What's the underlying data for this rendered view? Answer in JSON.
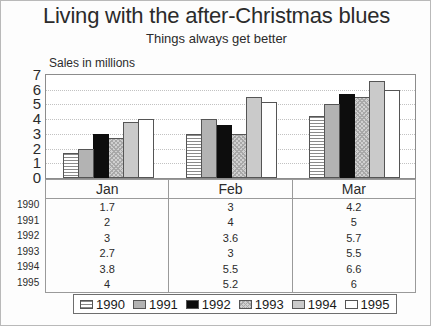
{
  "title": "Living with the after-Christmas blues",
  "subtitle": "Things always get better",
  "axis_note": "Sales in millions",
  "chart_data": {
    "type": "bar",
    "title": "Living with the after-Christmas blues",
    "subtitle": "Things always get better",
    "xlabel": "",
    "ylabel": "Sales in millions",
    "ylim": [
      0,
      7
    ],
    "yticks": [
      "0",
      "1",
      "2",
      "3",
      "4",
      "5",
      "6",
      "7"
    ],
    "grid": true,
    "legend_position": "bottom",
    "categories": [
      "Jan",
      "Feb",
      "Mar"
    ],
    "series": [
      {
        "name": "1990",
        "values": [
          1.7,
          3,
          4.2
        ],
        "pattern": "horizontal-lines",
        "color": "#ffffff"
      },
      {
        "name": "1991",
        "values": [
          2,
          4,
          5
        ],
        "pattern": "solid-gray",
        "color": "#b3b3b3"
      },
      {
        "name": "1992",
        "values": [
          3,
          3.6,
          5.7
        ],
        "pattern": "solid-black",
        "color": "#0d0d0d"
      },
      {
        "name": "1993",
        "values": [
          2.7,
          3,
          5.5
        ],
        "pattern": "checker-gray",
        "color": "#d0d0d0"
      },
      {
        "name": "1994",
        "values": [
          3.8,
          5.5,
          6.6
        ],
        "pattern": "light-gray",
        "color": "#cacaca"
      },
      {
        "name": "1995",
        "values": [
          4,
          5.2,
          6
        ],
        "pattern": "white",
        "color": "#ffffff"
      }
    ]
  },
  "table": {
    "row_headers": [
      "1990",
      "1991",
      "1992",
      "1993",
      "1994",
      "1995"
    ],
    "column_headers": [
      "Jan",
      "Feb",
      "Mar"
    ],
    "rows": [
      [
        "1.7",
        "3",
        "4.2"
      ],
      [
        "2",
        "4",
        "5"
      ],
      [
        "3",
        "3.6",
        "5.7"
      ],
      [
        "2.7",
        "3",
        "5.5"
      ],
      [
        "3.8",
        "5.5",
        "6.6"
      ],
      [
        "4",
        "5.2",
        "6"
      ]
    ]
  },
  "legend": {
    "items": [
      {
        "label": "1990"
      },
      {
        "label": "1991"
      },
      {
        "label": "1992"
      },
      {
        "label": "1993"
      },
      {
        "label": "1994"
      },
      {
        "label": "1995"
      }
    ]
  }
}
